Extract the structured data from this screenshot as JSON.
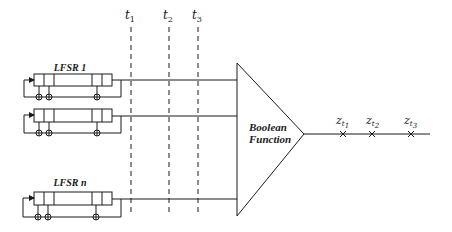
{
  "diagram": {
    "colors": {
      "stroke": "#1a1a1a",
      "background": "#ffffff"
    },
    "lfsrs": [
      {
        "label": "LFSR 1"
      },
      {
        "label": ""
      },
      {
        "label": "LFSR n"
      }
    ],
    "time_markers": [
      {
        "base": "t",
        "sub": "1"
      },
      {
        "base": "t",
        "sub": "2"
      },
      {
        "base": "t",
        "sub": "3"
      }
    ],
    "combiner": {
      "line1": "Boolean",
      "line2": "Function"
    },
    "outputs": [
      {
        "base": "z",
        "sub_base": "t",
        "sub": "1"
      },
      {
        "base": "z",
        "sub_base": "t",
        "sub": "2"
      },
      {
        "base": "z",
        "sub_base": "t",
        "sub": "3"
      }
    ]
  }
}
